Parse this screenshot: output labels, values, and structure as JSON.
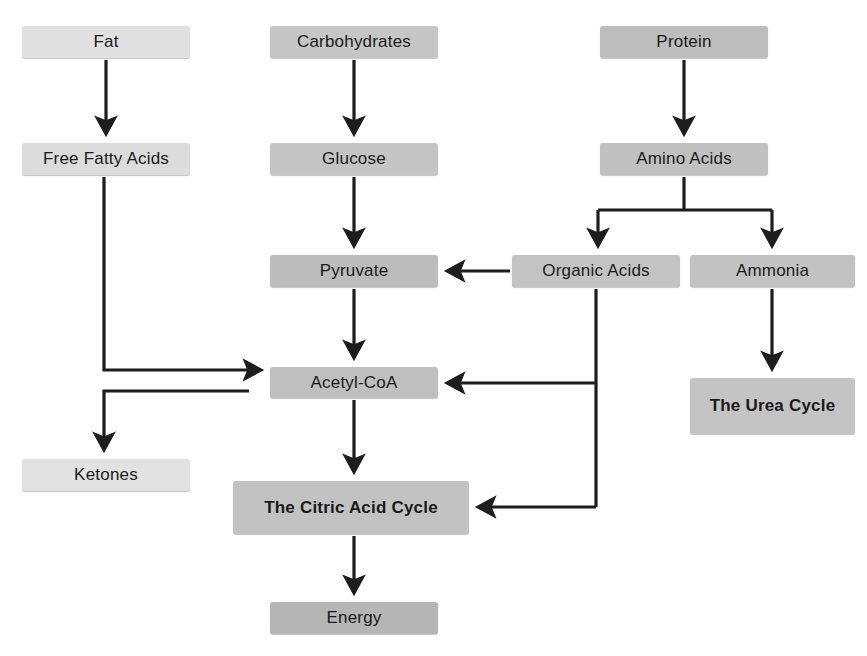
{
  "diagram": {
    "background_color": "#ffffff",
    "line_color": "#1d1d1d",
    "text_color": "#1a1a1a",
    "nodes": [
      {
        "id": "fat",
        "label": "Fat",
        "x": 22,
        "y": 26,
        "w": 168,
        "h": 32,
        "fill": "#e0e0e0",
        "bold": false
      },
      {
        "id": "carbohydrates",
        "label": "Carbohydrates",
        "x": 270,
        "y": 26,
        "w": 168,
        "h": 32,
        "fill": "#c6c6c6",
        "bold": false
      },
      {
        "id": "protein",
        "label": "Protein",
        "x": 600,
        "y": 26,
        "w": 168,
        "h": 32,
        "fill": "#bdbdbd",
        "bold": false
      },
      {
        "id": "free-fatty-acids",
        "label": "Free Fatty Acids",
        "x": 22,
        "y": 143,
        "w": 168,
        "h": 32,
        "fill": "#dcdcdc",
        "bold": false
      },
      {
        "id": "glucose",
        "label": "Glucose",
        "x": 270,
        "y": 143,
        "w": 168,
        "h": 32,
        "fill": "#c4c4c4",
        "bold": false
      },
      {
        "id": "amino-acids",
        "label": "Amino Acids",
        "x": 600,
        "y": 143,
        "w": 168,
        "h": 32,
        "fill": "#c0c0c0",
        "bold": false
      },
      {
        "id": "pyruvate",
        "label": "Pyruvate",
        "x": 270,
        "y": 255,
        "w": 168,
        "h": 32,
        "fill": "#bcbcbc",
        "bold": false
      },
      {
        "id": "organic-acids",
        "label": "Organic Acids",
        "x": 512,
        "y": 255,
        "w": 168,
        "h": 32,
        "fill": "#c3c3c3",
        "bold": false
      },
      {
        "id": "ammonia",
        "label": "Ammonia",
        "x": 690,
        "y": 255,
        "w": 165,
        "h": 32,
        "fill": "#c2c2c2",
        "bold": false
      },
      {
        "id": "acetyl-coa",
        "label": "Acetyl-CoA",
        "x": 270,
        "y": 367,
        "w": 168,
        "h": 31,
        "fill": "#bfbfbf",
        "bold": false
      },
      {
        "id": "the-urea-cycle",
        "label": "The Urea Cycle",
        "x": 690,
        "y": 378,
        "w": 165,
        "h": 56,
        "fill": "#c4c4c4",
        "bold": true
      },
      {
        "id": "ketones",
        "label": "Ketones",
        "x": 22,
        "y": 459,
        "w": 168,
        "h": 32,
        "fill": "#e2e2e2",
        "bold": false
      },
      {
        "id": "citric-acid-cycle",
        "label": "The Citric Acid Cycle",
        "x": 233,
        "y": 481,
        "w": 236,
        "h": 53,
        "fill": "#c2c2c2",
        "bold": true
      },
      {
        "id": "energy",
        "label": "Energy",
        "x": 270,
        "y": 602,
        "w": 168,
        "h": 32,
        "fill": "#b5b5b5",
        "bold": false
      }
    ],
    "edges": [
      {
        "id": "fat-to-free-fatty-acids",
        "from": "fat",
        "to": "free-fatty-acids",
        "kind": "straight-down"
      },
      {
        "id": "carbohydrates-to-glucose",
        "from": "carbohydrates",
        "to": "glucose",
        "kind": "straight-down"
      },
      {
        "id": "protein-to-amino-acids",
        "from": "protein",
        "to": "amino-acids",
        "kind": "straight-down"
      },
      {
        "id": "glucose-to-pyruvate",
        "from": "glucose",
        "to": "pyruvate",
        "kind": "straight-down"
      },
      {
        "id": "amino-acids-to-organic-acids",
        "from": "amino-acids",
        "to": "organic-acids",
        "kind": "split-left"
      },
      {
        "id": "amino-acids-to-ammonia",
        "from": "amino-acids",
        "to": "ammonia",
        "kind": "split-right"
      },
      {
        "id": "organic-acids-to-pyruvate",
        "from": "organic-acids",
        "to": "pyruvate",
        "kind": "straight-left"
      },
      {
        "id": "ammonia-to-the-urea-cycle",
        "from": "ammonia",
        "to": "the-urea-cycle",
        "kind": "straight-down"
      },
      {
        "id": "pyruvate-to-acetyl-coa",
        "from": "pyruvate",
        "to": "acetyl-coa",
        "kind": "straight-down"
      },
      {
        "id": "free-fatty-acids-to-acetyl-coa",
        "from": "free-fatty-acids",
        "to": "acetyl-coa",
        "kind": "elbow-down-right"
      },
      {
        "id": "acetyl-coa-to-ketones",
        "from": "acetyl-coa",
        "to": "ketones",
        "kind": "elbow-left-down"
      },
      {
        "id": "organic-acids-to-acetyl-coa",
        "from": "organic-acids",
        "to": "acetyl-coa",
        "kind": "elbow-down-left"
      },
      {
        "id": "organic-acids-to-citric-acid-cycle",
        "from": "organic-acids",
        "to": "citric-acid-cycle",
        "kind": "elbow-down-left"
      },
      {
        "id": "acetyl-coa-to-citric-acid-cycle",
        "from": "acetyl-coa",
        "to": "citric-acid-cycle",
        "kind": "straight-down"
      },
      {
        "id": "citric-acid-cycle-to-energy",
        "from": "citric-acid-cycle",
        "to": "energy",
        "kind": "straight-down"
      }
    ]
  }
}
